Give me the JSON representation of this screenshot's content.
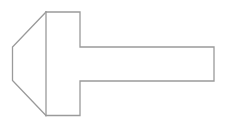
{
  "diagram": {
    "stroke_color": "#9a9a9a",
    "background": "#ffffff",
    "shapes": {
      "chamfer": {
        "points": [
          [
            46,
            12
          ],
          [
            12.5,
            47
          ],
          [
            12.5,
            80.5
          ],
          [
            46,
            115.5
          ]
        ]
      },
      "divider": {
        "x": 46,
        "y1": 12,
        "y2": 115.5
      },
      "head_and_shaft_outline": {
        "points": [
          [
            46,
            12
          ],
          [
            80,
            12
          ],
          [
            80,
            47
          ],
          [
            214,
            47
          ],
          [
            214,
            81
          ],
          [
            80,
            81
          ],
          [
            80,
            115.5
          ],
          [
            46,
            115.5
          ]
        ]
      }
    }
  }
}
